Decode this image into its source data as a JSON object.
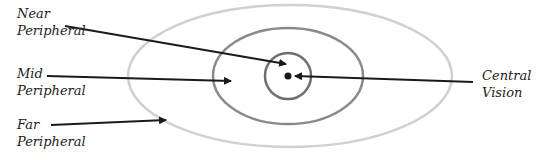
{
  "diagram": {
    "colors": {
      "outer_ring": "#d0d0d0",
      "middle_ring": "#8a8a8a",
      "inner_ring": "#6e6e6e",
      "arrow": "#1a1a1a",
      "text": "#222222"
    },
    "labels": [
      {
        "id": "near",
        "line1": "Near",
        "line2": "Peripheral"
      },
      {
        "id": "mid",
        "line1": "Mid",
        "line2": "Peripheral"
      },
      {
        "id": "far",
        "line1": "Far",
        "line2": "Peripheral"
      },
      {
        "id": "central",
        "line1": "Central",
        "line2": "Vision"
      }
    ]
  }
}
